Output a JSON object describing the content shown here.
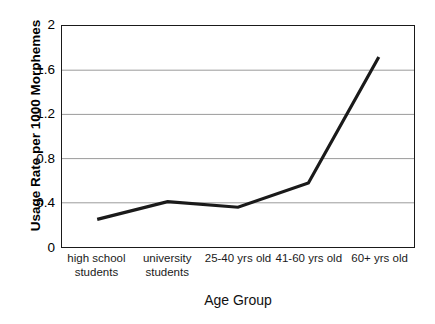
{
  "chart_data": {
    "type": "line",
    "title": "",
    "xlabel": "Age Group",
    "ylabel": "Usage Rate per 1000 Morphemes",
    "categories": [
      "high school students",
      "university students",
      "25-40 yrs old",
      "41-60 yrs old",
      "60+ yrs old"
    ],
    "category_lines": [
      [
        "high school",
        "students"
      ],
      [
        "university",
        "students"
      ],
      [
        "25-40 yrs old"
      ],
      [
        "41-60 yrs old"
      ],
      [
        "60+ yrs old"
      ]
    ],
    "values": [
      0.25,
      0.41,
      0.36,
      0.58,
      1.72
    ],
    "series": [
      {
        "name": "Usage Rate",
        "values": [
          0.25,
          0.41,
          0.36,
          0.58,
          1.72
        ],
        "color": "#1a1a1a"
      }
    ],
    "ylim": [
      0,
      2
    ],
    "yticks": [
      2,
      1.6,
      1.2,
      0.8,
      0.4,
      0
    ],
    "ytick_labels": [
      "2",
      "1.6",
      "1.2",
      "0.8",
      "0.4",
      "0"
    ],
    "grid": "horizontal",
    "gridline_color": "#9a9a9a",
    "legend": "none",
    "background": "#ffffff",
    "border_color": "#1a1a1a",
    "line_width": 3.2,
    "markers": "none"
  }
}
